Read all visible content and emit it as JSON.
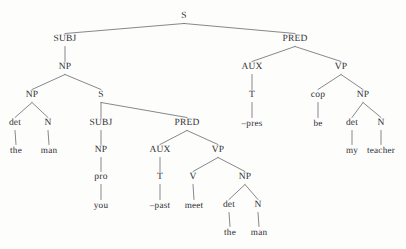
{
  "figure": {
    "kind": "syntax-tree",
    "sentence_reading": "the man you met -past is my teacher",
    "line_color": "#55555c",
    "text_color": "#2e2e33",
    "background_color": "#fdfdfc"
  },
  "nodes": [
    {
      "id": "s-root",
      "label": "S",
      "x": 184,
      "y": 17,
      "type": "category"
    },
    {
      "id": "subj-1",
      "label": "SUBJ",
      "x": 65,
      "y": 40,
      "type": "category"
    },
    {
      "id": "pred-1",
      "label": "PRED",
      "x": 295,
      "y": 40,
      "type": "category"
    },
    {
      "id": "np-1",
      "label": "NP",
      "x": 65,
      "y": 68,
      "type": "category"
    },
    {
      "id": "aux-1",
      "label": "AUX",
      "x": 252,
      "y": 68,
      "type": "category"
    },
    {
      "id": "vp-1",
      "label": "VP",
      "x": 341,
      "y": 68,
      "type": "category"
    },
    {
      "id": "np-2",
      "label": "NP",
      "x": 32,
      "y": 96,
      "type": "category"
    },
    {
      "id": "s-embedded",
      "label": "S",
      "x": 101,
      "y": 96,
      "type": "category"
    },
    {
      "id": "t-1",
      "label": "T",
      "x": 252,
      "y": 96,
      "type": "category"
    },
    {
      "id": "cop-1",
      "label": "cop",
      "x": 318,
      "y": 96,
      "type": "category"
    },
    {
      "id": "np-3",
      "label": "NP",
      "x": 363,
      "y": 96,
      "type": "category"
    },
    {
      "id": "det-1",
      "label": "det",
      "x": 15,
      "y": 124,
      "type": "category"
    },
    {
      "id": "n-1",
      "label": "N",
      "x": 48,
      "y": 124,
      "type": "category"
    },
    {
      "id": "subj-2",
      "label": "SUBJ",
      "x": 101,
      "y": 124,
      "type": "category"
    },
    {
      "id": "pred-2",
      "label": "PRED",
      "x": 187,
      "y": 124,
      "type": "category"
    },
    {
      "id": "pres-leaf",
      "label": "–pres",
      "x": 252,
      "y": 124,
      "type": "leaf"
    },
    {
      "id": "be-leaf",
      "label": "be",
      "x": 318,
      "y": 124,
      "type": "leaf"
    },
    {
      "id": "det-3",
      "label": "det",
      "x": 352,
      "y": 124,
      "type": "category"
    },
    {
      "id": "n-3",
      "label": "N",
      "x": 381,
      "y": 124,
      "type": "category"
    },
    {
      "id": "the-leaf-1",
      "label": "the",
      "x": 16,
      "y": 151,
      "type": "leaf"
    },
    {
      "id": "man-leaf-1",
      "label": "man",
      "x": 49,
      "y": 151,
      "type": "leaf"
    },
    {
      "id": "np-4",
      "label": "NP",
      "x": 101,
      "y": 151,
      "type": "category"
    },
    {
      "id": "aux-2",
      "label": "AUX",
      "x": 160,
      "y": 151,
      "type": "category"
    },
    {
      "id": "vp-2",
      "label": "VP",
      "x": 218,
      "y": 151,
      "type": "category"
    },
    {
      "id": "my-leaf",
      "label": "my",
      "x": 352,
      "y": 151,
      "type": "leaf"
    },
    {
      "id": "teacher-leaf",
      "label": "teacher",
      "x": 381,
      "y": 151,
      "type": "leaf"
    },
    {
      "id": "pro-1",
      "label": "pro",
      "x": 101,
      "y": 178,
      "type": "category"
    },
    {
      "id": "t-2",
      "label": "T",
      "x": 160,
      "y": 178,
      "type": "category"
    },
    {
      "id": "v-1",
      "label": "V",
      "x": 193,
      "y": 178,
      "type": "category"
    },
    {
      "id": "np-5",
      "label": "NP",
      "x": 245,
      "y": 178,
      "type": "category"
    },
    {
      "id": "you-leaf",
      "label": "you",
      "x": 101,
      "y": 206,
      "type": "leaf"
    },
    {
      "id": "past-leaf",
      "label": "–past",
      "x": 160,
      "y": 206,
      "type": "leaf"
    },
    {
      "id": "meet-leaf",
      "label": "meet",
      "x": 194,
      "y": 206,
      "type": "leaf"
    },
    {
      "id": "det-2",
      "label": "det",
      "x": 229,
      "y": 206,
      "type": "category"
    },
    {
      "id": "n-2",
      "label": "N",
      "x": 258,
      "y": 206,
      "type": "category"
    },
    {
      "id": "the-leaf-2",
      "label": "the",
      "x": 230,
      "y": 233,
      "type": "leaf"
    },
    {
      "id": "man-leaf-2",
      "label": "man",
      "x": 259,
      "y": 233,
      "type": "leaf"
    }
  ],
  "edges": [
    {
      "from": "s-root",
      "to": "subj-1"
    },
    {
      "from": "s-root",
      "to": "pred-1"
    },
    {
      "from": "subj-1",
      "to": "np-1"
    },
    {
      "from": "pred-1",
      "to": "aux-1"
    },
    {
      "from": "pred-1",
      "to": "vp-1"
    },
    {
      "from": "np-1",
      "to": "np-2"
    },
    {
      "from": "np-1",
      "to": "s-embedded"
    },
    {
      "from": "aux-1",
      "to": "t-1"
    },
    {
      "from": "vp-1",
      "to": "cop-1"
    },
    {
      "from": "vp-1",
      "to": "np-3"
    },
    {
      "from": "np-2",
      "to": "det-1"
    },
    {
      "from": "np-2",
      "to": "n-1"
    },
    {
      "from": "s-embedded",
      "to": "subj-2"
    },
    {
      "from": "s-embedded",
      "to": "pred-2"
    },
    {
      "from": "t-1",
      "to": "pres-leaf"
    },
    {
      "from": "cop-1",
      "to": "be-leaf"
    },
    {
      "from": "np-3",
      "to": "det-3"
    },
    {
      "from": "np-3",
      "to": "n-3"
    },
    {
      "from": "det-1",
      "to": "the-leaf-1"
    },
    {
      "from": "n-1",
      "to": "man-leaf-1"
    },
    {
      "from": "subj-2",
      "to": "np-4"
    },
    {
      "from": "pred-2",
      "to": "aux-2"
    },
    {
      "from": "pred-2",
      "to": "vp-2"
    },
    {
      "from": "det-3",
      "to": "my-leaf"
    },
    {
      "from": "n-3",
      "to": "teacher-leaf"
    },
    {
      "from": "np-4",
      "to": "pro-1"
    },
    {
      "from": "aux-2",
      "to": "t-2"
    },
    {
      "from": "vp-2",
      "to": "v-1"
    },
    {
      "from": "vp-2",
      "to": "np-5"
    },
    {
      "from": "pro-1",
      "to": "you-leaf"
    },
    {
      "from": "t-2",
      "to": "past-leaf"
    },
    {
      "from": "v-1",
      "to": "meet-leaf"
    },
    {
      "from": "np-5",
      "to": "det-2"
    },
    {
      "from": "np-5",
      "to": "n-2"
    },
    {
      "from": "det-2",
      "to": "the-leaf-2"
    },
    {
      "from": "n-2",
      "to": "man-leaf-2"
    }
  ]
}
